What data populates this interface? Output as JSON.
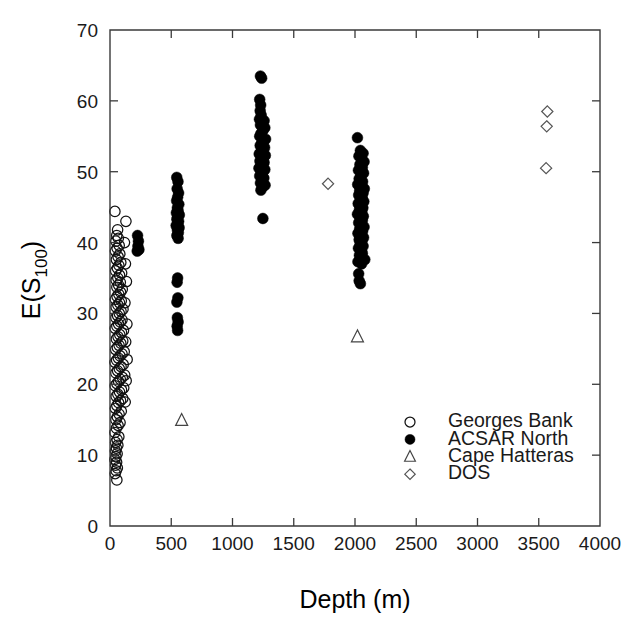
{
  "figure": {
    "background": "#ffffff",
    "axis_color": "#3a3a3a",
    "marker_color": "#000000"
  },
  "chart_data": {
    "type": "scatter",
    "title": "",
    "subtitle": "",
    "xlabel": "Depth (m)",
    "ylabel": "E(S",
    "ylabel_sub": "100",
    "ylabel_close": ")",
    "ylabel_full": "E(S100)",
    "xlim": [
      0,
      4000
    ],
    "ylim": [
      0,
      70
    ],
    "xticks": [
      0,
      500,
      1000,
      1500,
      2000,
      2500,
      3000,
      3500,
      4000
    ],
    "xticklabels": [
      "0",
      "500",
      "1000",
      "1500",
      "2000",
      "2500",
      "3000",
      "3500",
      "4000"
    ],
    "yticks": [
      0,
      10,
      20,
      30,
      40,
      50,
      60,
      70
    ],
    "yticklabels": [
      "0",
      "10",
      "20",
      "30",
      "40",
      "50",
      "60",
      "70"
    ],
    "grid": false,
    "tick_direction": "in",
    "legend_position": "lower right",
    "series": [
      {
        "name": "Georges Bank",
        "marker": "open-circle",
        "color": "#111111",
        "size": 5.2,
        "points": [
          [
            40,
            44.4
          ],
          [
            62,
            41.8
          ],
          [
            55,
            41.0
          ],
          [
            68,
            40.6
          ],
          [
            48,
            40.2
          ],
          [
            75,
            39.6
          ],
          [
            58,
            39.2
          ],
          [
            44,
            38.8
          ],
          [
            80,
            38.4
          ],
          [
            66,
            38.0
          ],
          [
            52,
            37.6
          ],
          [
            88,
            37.2
          ],
          [
            72,
            36.8
          ],
          [
            60,
            36.4
          ],
          [
            46,
            36.0
          ],
          [
            95,
            35.7
          ],
          [
            78,
            35.4
          ],
          [
            64,
            35.0
          ],
          [
            50,
            34.7
          ],
          [
            84,
            34.4
          ],
          [
            70,
            34.0
          ],
          [
            56,
            33.7
          ],
          [
            100,
            33.4
          ],
          [
            86,
            33.0
          ],
          [
            72,
            32.7
          ],
          [
            58,
            32.4
          ],
          [
            44,
            32.0
          ],
          [
            92,
            31.8
          ],
          [
            78,
            31.5
          ],
          [
            64,
            31.2
          ],
          [
            50,
            30.9
          ],
          [
            106,
            30.6
          ],
          [
            90,
            30.3
          ],
          [
            76,
            30.0
          ],
          [
            62,
            29.7
          ],
          [
            48,
            29.4
          ],
          [
            98,
            29.1
          ],
          [
            84,
            28.8
          ],
          [
            70,
            28.5
          ],
          [
            56,
            28.2
          ],
          [
            42,
            27.9
          ],
          [
            110,
            27.6
          ],
          [
            94,
            27.3
          ],
          [
            80,
            27.0
          ],
          [
            66,
            26.7
          ],
          [
            52,
            26.4
          ],
          [
            104,
            26.1
          ],
          [
            88,
            25.8
          ],
          [
            74,
            25.5
          ],
          [
            60,
            25.2
          ],
          [
            46,
            24.9
          ],
          [
            116,
            24.6
          ],
          [
            98,
            24.3
          ],
          [
            82,
            24.0
          ],
          [
            68,
            23.7
          ],
          [
            54,
            23.4
          ],
          [
            40,
            23.1
          ],
          [
            108,
            22.8
          ],
          [
            90,
            22.5
          ],
          [
            76,
            22.2
          ],
          [
            62,
            21.9
          ],
          [
            48,
            21.6
          ],
          [
            120,
            21.3
          ],
          [
            100,
            21.0
          ],
          [
            84,
            20.7
          ],
          [
            70,
            20.4
          ],
          [
            56,
            20.1
          ],
          [
            42,
            19.8
          ],
          [
            112,
            19.5
          ],
          [
            94,
            19.2
          ],
          [
            78,
            18.9
          ],
          [
            64,
            18.6
          ],
          [
            50,
            18.3
          ],
          [
            104,
            18.0
          ],
          [
            86,
            17.7
          ],
          [
            70,
            17.4
          ],
          [
            56,
            17.0
          ],
          [
            44,
            16.6
          ],
          [
            92,
            16.2
          ],
          [
            74,
            15.8
          ],
          [
            60,
            15.4
          ],
          [
            48,
            15.0
          ],
          [
            82,
            14.6
          ],
          [
            66,
            14.2
          ],
          [
            52,
            13.8
          ],
          [
            40,
            13.2
          ],
          [
            72,
            12.6
          ],
          [
            58,
            12.2
          ],
          [
            46,
            11.8
          ],
          [
            64,
            11.4
          ],
          [
            52,
            11.0
          ],
          [
            44,
            10.6
          ],
          [
            58,
            10.2
          ],
          [
            48,
            9.8
          ],
          [
            40,
            9.4
          ],
          [
            54,
            9.0
          ],
          [
            46,
            8.6
          ],
          [
            60,
            8.2
          ],
          [
            50,
            7.8
          ],
          [
            42,
            7.4
          ],
          [
            56,
            6.5
          ],
          [
            130,
            43.0
          ],
          [
            118,
            40.0
          ],
          [
            126,
            37.0
          ],
          [
            134,
            34.5
          ],
          [
            122,
            31.5
          ],
          [
            138,
            28.5
          ],
          [
            128,
            26.0
          ],
          [
            140,
            23.5
          ],
          [
            132,
            20.5
          ],
          [
            124,
            17.5
          ]
        ]
      },
      {
        "name": "ACSAR North",
        "marker": "filled-circle",
        "color": "#000000",
        "size": 5.4,
        "points": [
          [
            225,
            41.0
          ],
          [
            232,
            40.2
          ],
          [
            228,
            39.5
          ],
          [
            236,
            39.0
          ],
          [
            222,
            38.8
          ],
          [
            545,
            49.2
          ],
          [
            555,
            48.6
          ],
          [
            548,
            47.6
          ],
          [
            560,
            47.0
          ],
          [
            552,
            46.4
          ],
          [
            544,
            45.9
          ],
          [
            562,
            45.4
          ],
          [
            550,
            44.9
          ],
          [
            556,
            44.5
          ],
          [
            542,
            44.2
          ],
          [
            566,
            43.9
          ],
          [
            552,
            43.6
          ],
          [
            546,
            43.3
          ],
          [
            560,
            43.0
          ],
          [
            554,
            42.7
          ],
          [
            540,
            42.4
          ],
          [
            564,
            42.1
          ],
          [
            550,
            41.8
          ],
          [
            558,
            41.4
          ],
          [
            546,
            41.0
          ],
          [
            556,
            40.6
          ],
          [
            552,
            35.0
          ],
          [
            548,
            34.4
          ],
          [
            554,
            32.2
          ],
          [
            546,
            31.6
          ],
          [
            550,
            29.4
          ],
          [
            556,
            28.8
          ],
          [
            548,
            28.2
          ],
          [
            552,
            27.6
          ],
          [
            1228,
            63.5
          ],
          [
            1238,
            63.2
          ],
          [
            1222,
            60.2
          ],
          [
            1230,
            59.4
          ],
          [
            1226,
            58.6
          ],
          [
            1234,
            58.0
          ],
          [
            1220,
            57.4
          ],
          [
            1258,
            57.2
          ],
          [
            1240,
            56.9
          ],
          [
            1228,
            56.6
          ],
          [
            1264,
            56.2
          ],
          [
            1248,
            55.8
          ],
          [
            1232,
            55.4
          ],
          [
            1222,
            55.0
          ],
          [
            1270,
            54.6
          ],
          [
            1254,
            54.3
          ],
          [
            1238,
            54.0
          ],
          [
            1226,
            53.7
          ],
          [
            1262,
            53.4
          ],
          [
            1246,
            53.1
          ],
          [
            1232,
            52.8
          ],
          [
            1218,
            52.5
          ],
          [
            1268,
            52.3
          ],
          [
            1252,
            52.0
          ],
          [
            1236,
            51.8
          ],
          [
            1224,
            51.5
          ],
          [
            1258,
            51.3
          ],
          [
            1242,
            51.0
          ],
          [
            1230,
            50.8
          ],
          [
            1216,
            50.5
          ],
          [
            1264,
            50.3
          ],
          [
            1248,
            50.0
          ],
          [
            1234,
            49.7
          ],
          [
            1222,
            49.4
          ],
          [
            1256,
            49.1
          ],
          [
            1240,
            48.8
          ],
          [
            1228,
            48.4
          ],
          [
            1266,
            48.1
          ],
          [
            1244,
            47.8
          ],
          [
            1232,
            47.4
          ],
          [
            1248,
            43.4
          ]
        ]
      },
      {
        "name": "ACSAR North (deep)",
        "marker": "filled-circle",
        "color": "#000000",
        "size": 5.4,
        "hide_in_legend": true,
        "points": [
          [
            2020,
            54.8
          ],
          [
            2044,
            53.0
          ],
          [
            2066,
            52.6
          ],
          [
            2032,
            52.2
          ],
          [
            2056,
            51.8
          ],
          [
            2074,
            51.4
          ],
          [
            2040,
            51.0
          ],
          [
            2060,
            50.6
          ],
          [
            2028,
            50.2
          ],
          [
            2070,
            49.8
          ],
          [
            2048,
            49.4
          ],
          [
            2034,
            49.0
          ],
          [
            2062,
            48.6
          ],
          [
            2022,
            48.2
          ],
          [
            2054,
            47.9
          ],
          [
            2076,
            47.6
          ],
          [
            2038,
            47.3
          ],
          [
            2066,
            47.0
          ],
          [
            2030,
            46.7
          ],
          [
            2058,
            46.4
          ],
          [
            2044,
            46.1
          ],
          [
            2072,
            45.8
          ],
          [
            2026,
            45.5
          ],
          [
            2050,
            45.2
          ],
          [
            2064,
            44.9
          ],
          [
            2036,
            44.6
          ],
          [
            2056,
            44.3
          ],
          [
            2020,
            44.0
          ],
          [
            2068,
            43.7
          ],
          [
            2042,
            43.4
          ],
          [
            2060,
            43.1
          ],
          [
            2030,
            42.8
          ],
          [
            2052,
            42.5
          ],
          [
            2074,
            42.2
          ],
          [
            2038,
            41.9
          ],
          [
            2062,
            41.6
          ],
          [
            2024,
            41.3
          ],
          [
            2048,
            41.0
          ],
          [
            2070,
            40.7
          ],
          [
            2034,
            40.4
          ],
          [
            2056,
            40.1
          ],
          [
            2042,
            39.8
          ],
          [
            2066,
            39.5
          ],
          [
            2028,
            39.2
          ],
          [
            2052,
            38.9
          ],
          [
            2060,
            38.5
          ],
          [
            2036,
            38.2
          ],
          [
            2046,
            37.8
          ],
          [
            2080,
            37.6
          ],
          [
            2024,
            37.3
          ],
          [
            2054,
            37.0
          ],
          [
            2030,
            35.6
          ],
          [
            2034,
            34.6
          ],
          [
            2044,
            34.2
          ]
        ]
      },
      {
        "name": "Cape Hatteras",
        "marker": "open-triangle",
        "color": "#444444",
        "size": 6.0,
        "points": [
          [
            585,
            14.9
          ],
          [
            2020,
            26.7
          ]
        ]
      },
      {
        "name": "DOS",
        "marker": "open-diamond",
        "color": "#555555",
        "size": 5.6,
        "points": [
          [
            1780,
            48.3
          ],
          [
            3570,
            58.5
          ],
          [
            3565,
            56.4
          ],
          [
            3560,
            50.5
          ]
        ]
      }
    ],
    "legend_entries": [
      {
        "label": "Georges Bank",
        "marker": "open-circle"
      },
      {
        "label": "ACSAR North",
        "marker": "filled-circle"
      },
      {
        "label": "Cape Hatteras",
        "marker": "open-triangle"
      },
      {
        "label": "DOS",
        "marker": "open-diamond"
      }
    ]
  }
}
